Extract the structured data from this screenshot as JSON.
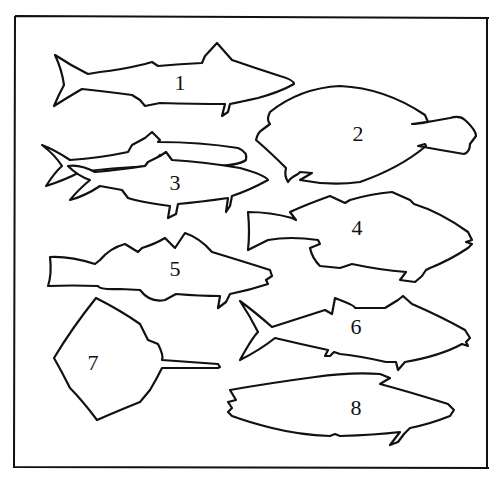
{
  "figure": {
    "type": "fish silhouette identification chart",
    "border_color": "#111111",
    "background": "#ffffff",
    "outline_color": "#111111"
  },
  "silhouettes": [
    {
      "id": 1,
      "label": "1",
      "shape": "mackerel-like fish, forked tail, facing right"
    },
    {
      "id": 2,
      "label": "2",
      "shape": "flatfish (flounder), oval body with small tail, facing left"
    },
    {
      "id": 3,
      "label": "3",
      "shape": "two overlapping herring-like fish, facing right"
    },
    {
      "id": 4,
      "label": "4",
      "shape": "bass/grouper-like fish with spiny dorsal fin, facing right"
    },
    {
      "id": 5,
      "label": "5",
      "shape": "cod-like fish with three dorsal fins, facing right"
    },
    {
      "id": 6,
      "label": "6",
      "shape": "tuna-like fish with crescent tail, facing right"
    },
    {
      "id": 7,
      "label": "7",
      "shape": "stingray / skate, diamond body with long tail"
    },
    {
      "id": 8,
      "label": "8",
      "shape": "elongated oval fish with truncated tail, facing right"
    }
  ]
}
